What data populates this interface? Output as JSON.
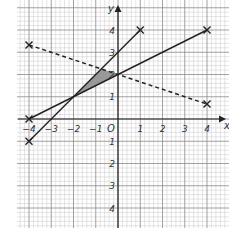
{
  "chart_data": {
    "type": "line",
    "title": "",
    "xlabel": "x",
    "ylabel": "y",
    "origin_label": "O",
    "xlim": [
      -4.2,
      4.6
    ],
    "ylim": [
      -4.5,
      4.9
    ],
    "x_ticks": [
      -4,
      -3,
      -2,
      -1,
      1,
      2,
      3,
      4
    ],
    "y_ticks": [
      4,
      3,
      2,
      1,
      -1,
      -2,
      -3,
      -4
    ],
    "grid": true,
    "series": [
      {
        "name": "line-y-half-x-plus-2",
        "style": "solid",
        "points": [
          [
            -4,
            0
          ],
          [
            4,
            4
          ]
        ],
        "markers": "cross"
      },
      {
        "name": "line-y-x-plus-3",
        "style": "solid",
        "points": [
          [
            -4,
            -1
          ],
          [
            1,
            4
          ]
        ],
        "markers": "cross"
      },
      {
        "name": "line-y-minus-third-x-plus-2",
        "style": "dashed",
        "points": [
          [
            -4,
            3.33
          ],
          [
            4,
            0.67
          ]
        ],
        "markers": "cross"
      }
    ],
    "shaded_region": {
      "vertices": [
        [
          -2,
          1
        ],
        [
          -0.75,
          2.25
        ],
        [
          0,
          2
        ]
      ],
      "color": "#999999"
    }
  },
  "labels": {
    "x_axis": "x",
    "y_axis": "y",
    "origin": "O",
    "xt": [
      "−4",
      "−3",
      "−2",
      "−1",
      "1",
      "2",
      "3",
      "4"
    ],
    "yt": [
      "4",
      "3",
      "2",
      "1",
      "1",
      "2",
      "3",
      "4"
    ]
  }
}
